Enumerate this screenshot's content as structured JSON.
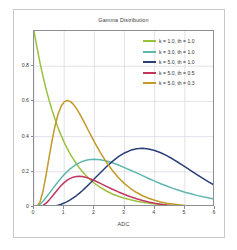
{
  "chart_data": {
    "type": "line",
    "title": "Gamma Distribution",
    "xlabel": "ADC",
    "ylabel": "",
    "xlim": [
      0,
      6
    ],
    "ylim": [
      0,
      1.0
    ],
    "grid": true,
    "legend_position": "top-right",
    "xticks": [
      "0",
      "1",
      "2",
      "3",
      "4",
      "5",
      "6"
    ],
    "xtick_values": [
      0,
      1,
      2,
      3,
      4,
      5,
      6
    ],
    "yticks": [
      "0",
      "0.2",
      "0.4",
      "0.6",
      "0.8"
    ],
    "ytick_values": [
      0,
      0.2,
      0.4,
      0.6,
      0.8
    ],
    "x": [
      0.0,
      0.1,
      0.2,
      0.3,
      0.4,
      0.5,
      0.6,
      0.7,
      0.8,
      0.9,
      1.0,
      1.1,
      1.2,
      1.3,
      1.4,
      1.5,
      1.6,
      1.7,
      1.8,
      1.9,
      2.0,
      2.2,
      2.4,
      2.6,
      2.8,
      3.0,
      3.2,
      3.4,
      3.6,
      3.8,
      4.0,
      4.2,
      4.4,
      4.6,
      4.8,
      5.0,
      5.2,
      5.4,
      5.6,
      5.8,
      6.0
    ],
    "series": [
      {
        "name": "k = 1.0, th = 1.0",
        "color": "#9ac13c",
        "k": 1.0,
        "theta": 1.0,
        "peak_x": 0.0,
        "peak_y": 1.0,
        "values": [
          1.0,
          0.905,
          0.819,
          0.741,
          0.67,
          0.607,
          0.549,
          0.497,
          0.449,
          0.407,
          0.368,
          0.333,
          0.301,
          0.273,
          0.247,
          0.223,
          0.202,
          0.183,
          0.165,
          0.15,
          0.135,
          0.111,
          0.091,
          0.074,
          0.061,
          0.05,
          0.041,
          0.033,
          0.027,
          0.022,
          0.018,
          0.015,
          0.012,
          0.01,
          0.008,
          0.007,
          0.006,
          0.005,
          0.004,
          0.003,
          0.002
        ]
      },
      {
        "name": "k = 3.0, th = 1.0",
        "color": "#5fb8ad",
        "k": 3.0,
        "theta": 1.0,
        "peak_x": 2.0,
        "peak_y": 0.271,
        "values": [
          0.0,
          0.005,
          0.016,
          0.033,
          0.054,
          0.076,
          0.099,
          0.122,
          0.144,
          0.165,
          0.184,
          0.201,
          0.217,
          0.23,
          0.242,
          0.251,
          0.259,
          0.264,
          0.268,
          0.27,
          0.271,
          0.268,
          0.261,
          0.251,
          0.239,
          0.224,
          0.209,
          0.194,
          0.178,
          0.162,
          0.147,
          0.132,
          0.119,
          0.106,
          0.095,
          0.084,
          0.075,
          0.066,
          0.058,
          0.051,
          0.045
        ]
      },
      {
        "name": "k = 5.0, th = 1.0",
        "color": "#2a3f7a",
        "k": 5.0,
        "theta": 1.0,
        "peak_x": 4.0,
        "peak_y": 0.195,
        "values": [
          0.0,
          3.8e-06,
          5e-05,
          0.00025,
          0.00078,
          0.00186,
          0.0037,
          0.00651,
          0.01047,
          0.01573,
          0.0224,
          0.03054,
          0.04018,
          0.05129,
          0.06379,
          0.07758,
          0.09252,
          0.10844,
          0.12515,
          0.14246,
          0.16062,
          0.19466,
          0.22836,
          0.25938,
          0.28601,
          0.30711,
          0.32206,
          0.33069,
          0.33314,
          0.32981,
          0.32132,
          0.3084,
          0.29188,
          0.27259,
          0.25137,
          0.22902,
          0.20627,
          0.18377,
          0.16206,
          0.14159,
          0.12262
        ]
      },
      {
        "name": "k = 5.0, th = 0.5",
        "color": "#c0365e",
        "k": 5.0,
        "theta": 0.5,
        "peak_x": 2.0,
        "peak_y": 0.391,
        "values": [
          0.0,
          0.00018,
          0.00215,
          0.00878,
          0.02147,
          0.03915,
          0.0598,
          0.08146,
          0.10256,
          0.1219,
          0.13863,
          0.15225,
          0.16253,
          0.1695,
          0.17333,
          0.17433,
          0.17288,
          0.16938,
          0.16424,
          0.15786,
          0.1506,
          0.13443,
          0.11764,
          0.10115,
          0.08555,
          0.0712,
          0.0583,
          0.04692,
          0.03706,
          0.02864,
          0.02154,
          0.01563,
          0.01079,
          0.00691,
          0.00389,
          0.00164,
          0.00085,
          0.00041,
          0.00019,
          9e-05,
          4e-05
        ]
      },
      {
        "name": "k = 5.0, th = 0.3",
        "color": "#c19a28",
        "k": 5.0,
        "theta": 0.3,
        "peak_x": 1.2,
        "peak_y": 0.652,
        "values": [
          0.0,
          0.00318,
          0.02948,
          0.09116,
          0.18075,
          0.28134,
          0.3789,
          0.46313,
          0.52829,
          0.57274,
          0.59762,
          0.60549,
          0.60003,
          0.58432,
          0.56144,
          0.53344,
          0.50238,
          0.46959,
          0.43614,
          0.40297,
          0.37053,
          0.30922,
          0.25456,
          0.20714,
          0.16672,
          0.13295,
          0.10503,
          0.08232,
          0.06399,
          0.04939,
          0.03788,
          0.02886,
          0.02187,
          0.01648,
          0.01237,
          0.00923,
          0.00686,
          0.00508,
          0.00374,
          0.00275,
          0.00201
        ]
      }
    ]
  },
  "legend": {
    "entries": [
      {
        "label": "k = 1.0, th = 1.0",
        "color": "#9ac13c"
      },
      {
        "label": "k = 3.0, th = 1.0",
        "color": "#5fb8ad"
      },
      {
        "label": "k = 5.0, th = 1.0",
        "color": "#2a3f7a"
      },
      {
        "label": "k = 5.0, th = 0.5",
        "color": "#c0365e"
      },
      {
        "label": "k = 5.0, th = 0.3",
        "color": "#c19a28"
      }
    ]
  },
  "colors": {
    "background": "#ffffff",
    "frame": "#c8c8cf",
    "axis": "#8d8d96",
    "grid": "#d6d6e0",
    "text": "#3a3a3a"
  }
}
